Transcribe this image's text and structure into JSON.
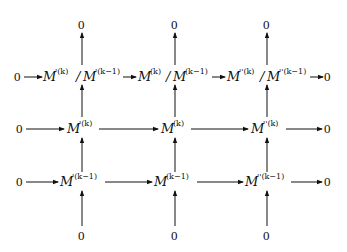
{
  "diagram": {
    "type": "commutative_diagram",
    "rows": [
      {
        "name": "quotient-row",
        "left": "0",
        "nodes": [
          {
            "base": "M",
            "sup": "'(k)",
            "slash": "/",
            "base2": "M",
            "sup2": "'(k−1)"
          },
          {
            "base": "M",
            "sup": "(k)",
            "slash": "/",
            "base2": "M",
            "sup2": "(k−1)"
          },
          {
            "base": "M",
            "sup": "''(k)",
            "slash": "/",
            "base2": "M",
            "sup2": "''(k−1)"
          }
        ],
        "right": "0"
      },
      {
        "name": "filtration-k-row",
        "left": "0",
        "nodes": [
          {
            "base": "M",
            "sup": "'(k)"
          },
          {
            "base": "M",
            "sup": "(k)"
          },
          {
            "base": "M",
            "sup": "''(k)"
          }
        ],
        "right": "0"
      },
      {
        "name": "filtration-k-minus-1-row",
        "left": "0",
        "nodes": [
          {
            "base": "M",
            "sup": "'(k−1)"
          },
          {
            "base": "M",
            "sup": "(k−1)"
          },
          {
            "base": "M",
            "sup": "''(k−1)"
          }
        ],
        "right": "0"
      }
    ],
    "top_zeros": [
      "0",
      "0",
      "0"
    ],
    "bottom_zeros": [
      "0",
      "0",
      "0"
    ],
    "arrow_color": "#111111"
  }
}
